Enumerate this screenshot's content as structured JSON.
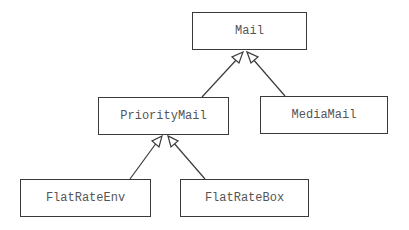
{
  "diagram": {
    "type": "uml-class-inheritance",
    "colors": {
      "line": "#3a3a3a",
      "text": "#555555",
      "background": "#ffffff"
    },
    "classes": [
      {
        "id": "mail",
        "label": "Mail",
        "x": 192,
        "y": 12,
        "w": 115,
        "h": 38
      },
      {
        "id": "priority",
        "label": "PriorityMail",
        "x": 98,
        "y": 97,
        "w": 131,
        "h": 38
      },
      {
        "id": "media",
        "label": "MediaMail",
        "x": 260,
        "y": 96,
        "w": 128,
        "h": 38
      },
      {
        "id": "flatenv",
        "label": "FlatRateEnv",
        "x": 20,
        "y": 179,
        "w": 131,
        "h": 38
      },
      {
        "id": "flatbox",
        "label": "FlatRateBox",
        "x": 180,
        "y": 179,
        "w": 129,
        "h": 38
      }
    ],
    "inheritance": [
      {
        "child": "PriorityMail",
        "parent": "Mail"
      },
      {
        "child": "MediaMail",
        "parent": "Mail"
      },
      {
        "child": "FlatRateEnv",
        "parent": "PriorityMail"
      },
      {
        "child": "FlatRateBox",
        "parent": "PriorityMail"
      }
    ]
  }
}
